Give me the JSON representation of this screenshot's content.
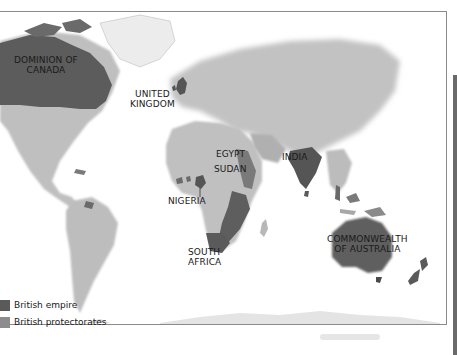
{
  "map": {
    "title": "British Empire world map",
    "colors": {
      "british_empire": "#5a5a5a",
      "british_protectorates": "#8c8c8c",
      "land": "#c4c4c4",
      "land_light": "#dedede",
      "ice": "#f0f0f0",
      "ocean": "#ffffff",
      "frame": "#8a8a8a"
    },
    "labels": {
      "canada": [
        "DOMINION OF",
        "CANADA"
      ],
      "uk": [
        "UNITED",
        "KINGDOM"
      ],
      "egypt": "EGYPT",
      "sudan": "SUDAN",
      "india": "INDIA",
      "nigeria": "NIGERIA",
      "south_africa": [
        "SOUTH",
        "AFRICA"
      ],
      "australia": [
        "COMMONWEALTH",
        "OF AUSTRALIA"
      ]
    }
  },
  "legend": {
    "items": [
      {
        "label": "British empire",
        "color": "#5a5a5a"
      },
      {
        "label": "British protectorates",
        "color": "#8c8c8c"
      }
    ]
  }
}
